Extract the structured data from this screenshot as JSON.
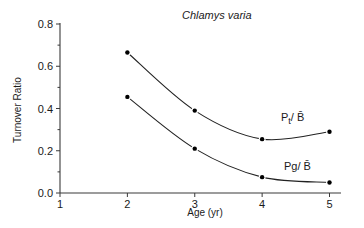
{
  "chart_data": {
    "type": "line",
    "title": "Chlamys varia",
    "xlabel": "Age (yr)",
    "ylabel": "Turnover Ratio",
    "x": [
      2,
      3,
      4,
      5
    ],
    "xlim": [
      1,
      5
    ],
    "ylim": [
      0.0,
      0.8
    ],
    "x_ticks": [
      "1",
      "2",
      "3",
      "4",
      "5"
    ],
    "y_ticks": [
      "0.0",
      "0.2",
      "0.4",
      "0.6",
      "0.8"
    ],
    "y_minor_step": 0.1,
    "grid": false,
    "legend": "inline labels near right end of each curve",
    "series": [
      {
        "name": "Pt/ B̄",
        "label_main": "P",
        "label_sub": "t",
        "label_rest": "/ B̄",
        "values": [
          0.665,
          0.39,
          0.255,
          0.29
        ],
        "smooth": true
      },
      {
        "name": "Pg/ B̄",
        "label_main": "Pg/ B̄",
        "values": [
          0.455,
          0.21,
          0.075,
          0.05
        ],
        "smooth": true
      }
    ]
  }
}
